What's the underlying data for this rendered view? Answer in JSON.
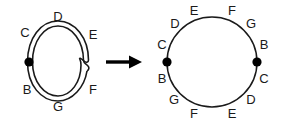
{
  "figure": {
    "stroke_color": "#1a1a1a",
    "dot_color": "#000000",
    "background": "#ffffff",
    "arrow": {
      "glyph": "arrow-right",
      "label": ""
    }
  },
  "left_diagram": {
    "name": "doubled-loop-with-crossing",
    "description": "Two nearly concentric closed curves forming a doubled loop, with a crossing on the right side and a basepoint dot on the left side",
    "basepoint_count": 1,
    "labels": [
      {
        "text": "D",
        "position": "top",
        "x": 58,
        "y": 17
      },
      {
        "text": "C",
        "position": "upper-left",
        "x": 25,
        "y": 33
      },
      {
        "text": "E",
        "position": "upper-right",
        "x": 92,
        "y": 35
      },
      {
        "text": "B",
        "position": "lower-left",
        "x": 27,
        "y": 90
      },
      {
        "text": "F",
        "position": "lower-right",
        "x": 92,
        "y": 90
      },
      {
        "text": "G",
        "position": "bottom",
        "x": 58,
        "y": 107
      }
    ],
    "dots": [
      {
        "x": 26,
        "y": 62,
        "r": 4.6
      }
    ],
    "crossing": {
      "x": 83,
      "y": 60
    }
  },
  "right_diagram": {
    "name": "single-circle",
    "description": "A single circle with two basepoint dots at left and right, labelled with two copies of the sequence B C D E F G",
    "basepoint_count": 2,
    "center": {
      "x": 212,
      "y": 62
    },
    "radius": 45,
    "labels": [
      {
        "text": "E",
        "position": "top-left-of-apex",
        "x": 194,
        "y": 11
      },
      {
        "text": "F",
        "position": "top-right-of-apex",
        "x": 232,
        "y": 11
      },
      {
        "text": "D",
        "position": "upper-left",
        "x": 175,
        "y": 24
      },
      {
        "text": "G",
        "position": "upper-right",
        "x": 250,
        "y": 24
      },
      {
        "text": "C",
        "position": "left-upper",
        "x": 162,
        "y": 45
      },
      {
        "text": "B",
        "position": "right-upper",
        "x": 263,
        "y": 45
      },
      {
        "text": "B",
        "position": "left-lower",
        "x": 162,
        "y": 79
      },
      {
        "text": "C",
        "position": "right-lower",
        "x": 263,
        "y": 79
      },
      {
        "text": "G",
        "position": "lower-left",
        "x": 174,
        "y": 101
      },
      {
        "text": "D",
        "position": "lower-right",
        "x": 250,
        "y": 101
      },
      {
        "text": "F",
        "position": "bottom-left-of-base",
        "x": 194,
        "y": 114
      },
      {
        "text": "E",
        "position": "bottom-right-of-base",
        "x": 232,
        "y": 114
      }
    ],
    "dots": [
      {
        "x": 167,
        "y": 62,
        "r": 4.6
      },
      {
        "x": 257,
        "y": 62,
        "r": 4.6
      }
    ]
  }
}
